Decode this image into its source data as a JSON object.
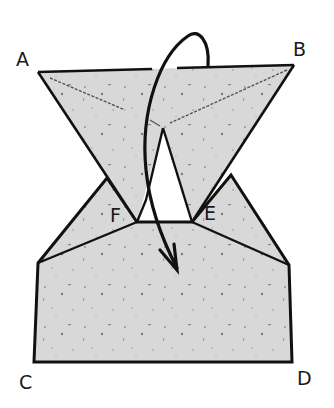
{
  "diagram": {
    "type": "origami-fold-step",
    "labels": {
      "A": "A",
      "B": "B",
      "C": "C",
      "D": "D",
      "E": "E",
      "F": "F"
    },
    "colors": {
      "paper": "#d9d9d9",
      "line": "#111111",
      "crease": "#555555",
      "background": "#ffffff"
    }
  }
}
